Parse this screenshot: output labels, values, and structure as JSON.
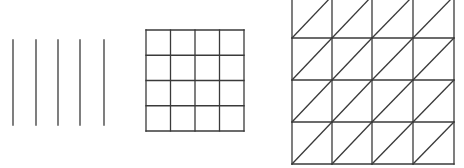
{
  "figures": [
    {
      "id": "parallel-lines",
      "type": "vertical-lines",
      "count": 5,
      "x": [
        13,
        36,
        58,
        80,
        104
      ],
      "y_top": 40,
      "y_bottom": 125
    },
    {
      "id": "square-grid",
      "type": "grid",
      "rows": 4,
      "cols": 4,
      "left": 146,
      "top": 30,
      "right": 244,
      "bottom": 131
    },
    {
      "id": "triangulated-grid",
      "type": "grid-with-diagonals",
      "rows": 4,
      "cols": 4,
      "diagonal": "bottom-left-to-top-right",
      "col_x": [
        292,
        332,
        372,
        413,
        454
      ],
      "row_y": [
        -4,
        38,
        80,
        122,
        164
      ]
    }
  ],
  "colors": {
    "stroke": "#3a3a3a",
    "background": "#ffffff"
  }
}
